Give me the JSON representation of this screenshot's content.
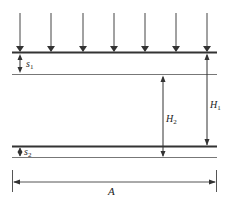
{
  "diagram": {
    "colors": {
      "line": "#333333",
      "thin_line": "#666666",
      "background": "#ffffff"
    },
    "load_arrows": {
      "count": 7,
      "x_positions": [
        20,
        51,
        83,
        114,
        145,
        176,
        207
      ],
      "y_start": 13,
      "y_end": 52
    },
    "layers": [
      {
        "name": "upper-layer",
        "top_y": 52,
        "bottom_y": 74,
        "thickness_label": "s",
        "thickness_sub": "1"
      },
      {
        "name": "lower-layer",
        "top_y": 146,
        "bottom_y": 157,
        "thickness_label": "s",
        "thickness_sub": "2"
      }
    ],
    "dimensions": {
      "H1": {
        "label": "H",
        "sub": "1"
      },
      "H2": {
        "label": "H",
        "sub": "2"
      },
      "A": {
        "label": "A"
      }
    }
  }
}
